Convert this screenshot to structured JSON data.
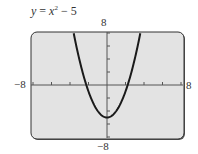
{
  "chart_data": {
    "type": "line",
    "title_parts": {
      "lhs": "y",
      "eq": "=",
      "var": "x",
      "exp": "2",
      "op": "−",
      "const": "5"
    },
    "xlabel": "",
    "ylabel": "",
    "xlim": [
      -8,
      8
    ],
    "ylim": [
      -8,
      8
    ],
    "x_tick_step": 2,
    "y_tick_step": 2,
    "grid": false,
    "window_labels": {
      "xmin": "−8",
      "xmax": "8",
      "ymin": "−8",
      "ymax": "8"
    },
    "series": [
      {
        "name": "y = x^2 - 5",
        "function": "x^2 - 5",
        "x": [
          -3.6,
          -3,
          -2,
          -1,
          0,
          1,
          2,
          3,
          3.6
        ],
        "values": [
          7.96,
          4,
          -1,
          -4,
          -5,
          -4,
          -1,
          4,
          7.96
        ]
      }
    ],
    "colors": {
      "curve": "#1a1a1a",
      "screen": "#e3e3e3",
      "frame": "#333333"
    }
  }
}
